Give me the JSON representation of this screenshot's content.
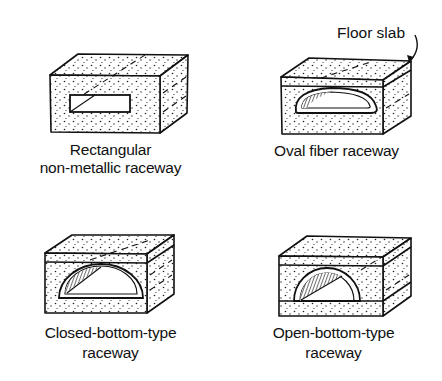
{
  "diagram": {
    "colors": {
      "ink": "#111111",
      "background": "#ffffff"
    },
    "callout": {
      "label": "Floor slab",
      "arrow": "curved-arrow-pointing-to-slab-top"
    },
    "panels": [
      {
        "id": "rectangular",
        "caption_line1": "Rectangular",
        "caption_line2": "non-metallic raceway",
        "opening_shape": "rectangle"
      },
      {
        "id": "oval",
        "caption_line1": "Oval fiber raceway",
        "caption_line2": "",
        "opening_shape": "oval"
      },
      {
        "id": "closed-bottom",
        "caption_line1": "Closed-bottom-type",
        "caption_line2": "raceway",
        "opening_shape": "semicircle-closed"
      },
      {
        "id": "open-bottom",
        "caption_line1": "Open-bottom-type",
        "caption_line2": "raceway",
        "opening_shape": "semicircle-open"
      }
    ]
  }
}
